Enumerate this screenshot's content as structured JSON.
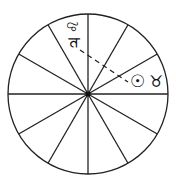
{
  "diagram": {
    "type": "astrological-wheel",
    "center": [
      88,
      94
    ],
    "radius": 80,
    "divisions": 12,
    "stroke_color": "#222222",
    "glyphs": {
      "leo": "♌",
      "jupiter": "♃",
      "sun": "☉",
      "taurus": "♉"
    },
    "aspect_line": {
      "from": "jupiter",
      "to": "sun",
      "style": "dashed"
    }
  }
}
